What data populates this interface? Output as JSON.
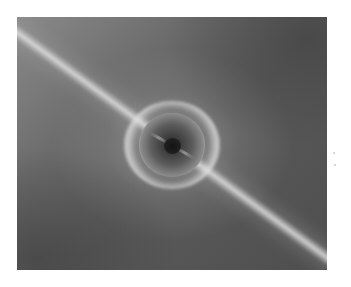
{
  "image": {
    "description": "Grayscale astronomical image: a bright ring with a dark central core, crossed diagonally by a bright streak from upper-left to lower-right",
    "background_color": "#ffffff",
    "colors": {
      "background_dark": "#4e4e4e",
      "background_light": "#8a8a8a",
      "ring_bright": "#e6e6e6",
      "core_dark": "#141414"
    }
  }
}
